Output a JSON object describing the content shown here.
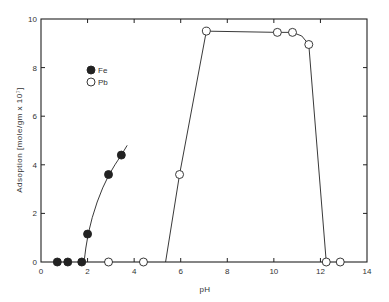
{
  "chart_data": {
    "type": "scatter",
    "title": "",
    "xlabel": "pH",
    "ylabel": "Adsoption [mole/gm x 10⁷]",
    "xlim": [
      0,
      14
    ],
    "ylim": [
      0,
      10
    ],
    "xticks": [
      0,
      2,
      4,
      6,
      8,
      10,
      12,
      14
    ],
    "yticks": [
      0,
      2,
      4,
      6,
      8,
      10
    ],
    "grid": false,
    "legend_position": "upper-left inside",
    "series": [
      {
        "name": "Fe",
        "marker": "filled-circle",
        "points": [
          {
            "x": 0.7,
            "y": 0
          },
          {
            "x": 1.15,
            "y": 0
          },
          {
            "x": 1.75,
            "y": 0
          },
          {
            "x": 2.0,
            "y": 1.15
          },
          {
            "x": 2.9,
            "y": 3.6
          },
          {
            "x": 3.45,
            "y": 4.4
          }
        ],
        "curve": [
          {
            "x": 1.85,
            "y": 0
          },
          {
            "x": 2.0,
            "y": 1.15
          },
          {
            "x": 2.4,
            "y": 2.5
          },
          {
            "x": 2.9,
            "y": 3.6
          },
          {
            "x": 3.45,
            "y": 4.4
          },
          {
            "x": 3.7,
            "y": 4.8
          }
        ]
      },
      {
        "name": "Pb",
        "marker": "open-circle",
        "points": [
          {
            "x": 2.9,
            "y": 0
          },
          {
            "x": 4.4,
            "y": 0
          },
          {
            "x": 5.95,
            "y": 3.6
          },
          {
            "x": 7.1,
            "y": 9.5
          },
          {
            "x": 10.15,
            "y": 9.45
          },
          {
            "x": 10.8,
            "y": 9.45
          },
          {
            "x": 11.5,
            "y": 8.95
          },
          {
            "x": 12.25,
            "y": 0
          },
          {
            "x": 12.85,
            "y": 0
          }
        ],
        "curve": [
          {
            "x": 5.35,
            "y": 0
          },
          {
            "x": 5.95,
            "y": 3.6
          },
          {
            "x": 7.1,
            "y": 9.5
          },
          {
            "x": 10.15,
            "y": 9.45
          },
          {
            "x": 10.8,
            "y": 9.45
          },
          {
            "x": 11.2,
            "y": 9.3
          },
          {
            "x": 11.5,
            "y": 8.95
          },
          {
            "x": 12.25,
            "y": 0
          }
        ]
      }
    ]
  },
  "legend": {
    "items": [
      {
        "label": "Fe",
        "marker": "filled-circle"
      },
      {
        "label": "Pb",
        "marker": "open-circle"
      }
    ]
  },
  "colors": {
    "ink": "#222222",
    "background": "#ffffff"
  }
}
